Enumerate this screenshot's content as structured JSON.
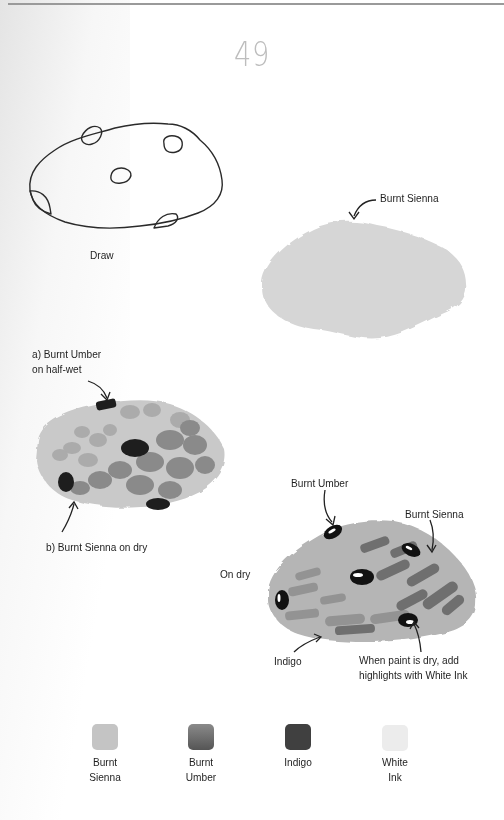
{
  "page": {
    "number": "49"
  },
  "steps": {
    "draw": {
      "label": "Draw"
    },
    "base_wash": {
      "label": "Burnt Sienna"
    },
    "texture": {
      "label_a_line1": "a) Burnt Umber",
      "label_a_line2": "on half-wet",
      "label_b": "b) Burnt Sienna on dry"
    },
    "final": {
      "label_burnt_umber": "Burnt Umber",
      "label_burnt_sienna": "Burnt Sienna",
      "label_on_dry": "On dry",
      "label_indigo": "Indigo",
      "label_highlight_line1": "When paint is dry, add",
      "label_highlight_line2": "highlights with White Ink"
    }
  },
  "palette": {
    "swatches": [
      {
        "name_line1": "Burnt",
        "name_line2": "Sienna",
        "color": "#c4c4c4"
      },
      {
        "name_line1": "Burnt",
        "name_line2": "Umber",
        "color": "#6e6e6e"
      },
      {
        "name_line1": "Indigo",
        "name_line2": "",
        "color": "#404040"
      },
      {
        "name_line1": "White",
        "name_line2": "Ink",
        "color": "#ececec"
      }
    ]
  }
}
